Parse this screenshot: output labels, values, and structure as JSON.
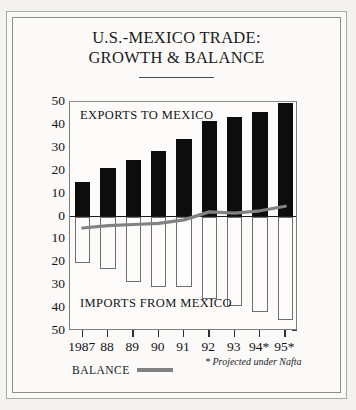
{
  "title": {
    "line1": "U.S.-MEXICO TRADE:",
    "line2": "GROWTH & BALANCE"
  },
  "footnote": "* Projected under Nafta",
  "legend": {
    "balance_label": "BALANCE",
    "balance_color": "#828282"
  },
  "labels": {
    "exports": "EXPORTS TO MEXICO",
    "imports": "IMPORTS FROM MEXICO",
    "y_axis_title": "BILLIONS OF DOLLARS"
  },
  "colors": {
    "exports_bar": "#0d0d0d",
    "imports_bar": "#fdfcfa",
    "imports_outline": "#6e6e6e",
    "balance_line": "#828282",
    "frame": "#8d8d8b",
    "background": "#fbfaf8"
  },
  "chart_data": {
    "type": "bar",
    "title": "U.S.-MEXICO TRADE: GROWTH & BALANCE",
    "xlabel": "",
    "ylabel": "BILLIONS OF DOLLARS",
    "ylim": [
      -50,
      50
    ],
    "yticks": [
      50,
      40,
      30,
      20,
      10,
      0,
      10,
      20,
      30,
      40,
      50
    ],
    "ytick_values": [
      50,
      40,
      30,
      20,
      10,
      0,
      -10,
      -20,
      -30,
      -40,
      -50
    ],
    "grid": false,
    "legend_position": "below-axis",
    "categories": [
      "1987",
      "88",
      "89",
      "90",
      "91",
      "92",
      "93",
      "94*",
      "95*"
    ],
    "series": [
      {
        "name": "EXPORTS TO MEXICO",
        "type": "bar",
        "color": "#0d0d0d",
        "values": [
          15,
          21,
          24.5,
          28.5,
          34,
          41.5,
          43.5,
          45.5,
          49.5
        ]
      },
      {
        "name": "IMPORTS FROM MEXICO",
        "type": "bar",
        "color": "#ffffff",
        "values": [
          -20.5,
          -23,
          -28.5,
          -31,
          -31,
          -36,
          -39,
          -41.5,
          -45
        ]
      },
      {
        "name": "BALANCE",
        "type": "line",
        "color": "#828282",
        "values": [
          -5,
          -4,
          -3.5,
          -3,
          -1.5,
          2,
          1.5,
          2.5,
          4.5
        ]
      }
    ],
    "annotations": [
      "* Projected under Nafta"
    ]
  }
}
